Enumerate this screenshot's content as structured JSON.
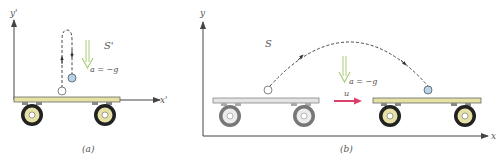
{
  "figure_a": {
    "caption": "(a)",
    "frame_label": "S'",
    "x_axis_label": "x'",
    "y_axis_label": "y'",
    "acceleration_label": "a = −g"
  },
  "figure_b": {
    "caption": "(b)",
    "frame_label": "S",
    "x_axis_label": "x",
    "y_axis_label": "y",
    "acceleration_label": "a = −g",
    "velocity_label": "u"
  },
  "colors": {
    "cart_yellow": "#e6e2a6",
    "cart_gray": "#e4e4e4",
    "ball_blue": "#b8d4ea",
    "accel_arrow_green": "#a9cc7a",
    "velocity_arrow_red": "#d8426a",
    "axis": "#444444"
  }
}
